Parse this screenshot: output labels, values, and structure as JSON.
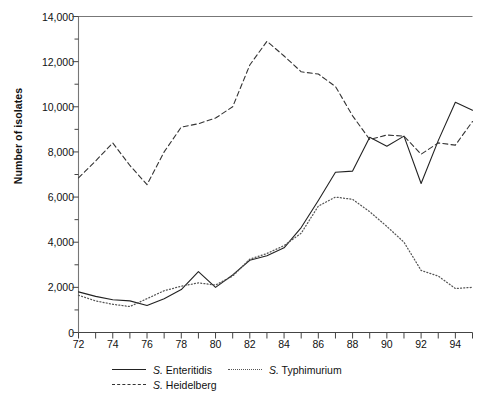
{
  "chart_data": {
    "type": "line",
    "title": "",
    "xlabel": "",
    "ylabel": "Number of isolates",
    "xlim": [
      72,
      95
    ],
    "ylim": [
      0,
      14000
    ],
    "grid": false,
    "legend_position": "bottom-left",
    "ytick_labels": [
      "0",
      "2,000",
      "4,000",
      "6,000",
      "8,000",
      "10,000",
      "12,000",
      "14,000"
    ],
    "ytick_values": [
      0,
      2000,
      4000,
      6000,
      8000,
      10000,
      12000,
      14000
    ],
    "yminor_step": 1000,
    "xtick_labels": [
      "72",
      "74",
      "76",
      "78",
      "80",
      "82",
      "84",
      "86",
      "88",
      "90",
      "92",
      "94"
    ],
    "xtick_values": [
      72,
      74,
      76,
      78,
      80,
      82,
      84,
      86,
      88,
      90,
      92,
      94
    ],
    "xminor_step": 1,
    "x": [
      72,
      73,
      74,
      75,
      76,
      77,
      78,
      79,
      80,
      81,
      82,
      83,
      84,
      85,
      86,
      87,
      88,
      89,
      90,
      91,
      92,
      93,
      94,
      95
    ],
    "series": [
      {
        "name": "S. Enteritidis",
        "style": "solid",
        "color": "#222222",
        "values": [
          1800,
          1600,
          1450,
          1400,
          1200,
          1500,
          1900,
          2700,
          2000,
          2550,
          3200,
          3400,
          3750,
          4650,
          5850,
          7100,
          7150,
          8650,
          8250,
          8700,
          6600,
          8500,
          10200,
          9850
        ]
      },
      {
        "name": "S. Typhimurium",
        "style": "dotted",
        "color": "#555555",
        "values": [
          1650,
          1400,
          1250,
          1150,
          1500,
          1850,
          2050,
          2200,
          2100,
          2500,
          3250,
          3500,
          3850,
          4400,
          5600,
          6000,
          5900,
          5350,
          4700,
          4000,
          2750,
          2500,
          1950,
          2000
        ]
      },
      {
        "name": "S. Heidelberg",
        "style": "dashed",
        "color": "#333333",
        "values": [
          6850,
          7600,
          8400,
          7400,
          6550,
          8000,
          9100,
          9250,
          9500,
          10000,
          11850,
          12900,
          12250,
          11550,
          11450,
          10900,
          9600,
          8550,
          8750,
          8700,
          7900,
          8400,
          8300,
          9350
        ]
      }
    ],
    "legend": [
      {
        "label": "S. Enteritidis",
        "style": "solid"
      },
      {
        "label": "S. Typhimurium",
        "style": "dotted"
      },
      {
        "label": "S. Heidelberg",
        "style": "dashed"
      }
    ]
  }
}
